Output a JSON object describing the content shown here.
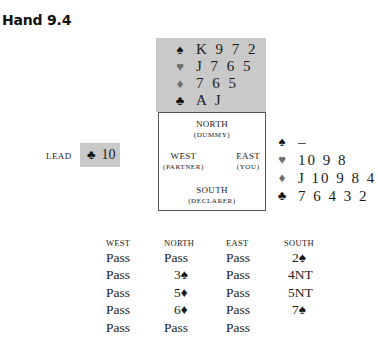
{
  "title": "Hand 9.4",
  "north_hand": {
    "spades": "K 9 7 2",
    "hearts": "J 7 6 5",
    "diamonds": "7 6 5",
    "clubs": "A J"
  },
  "east_hand": {
    "spades": "–",
    "hearts": "10 9 8",
    "diamonds": "J 10 9 8 4",
    "clubs": "7 6 4 3 2"
  },
  "suits": {
    "spade": "♠",
    "heart": "♥",
    "diamond": "♦",
    "club": "♣"
  },
  "compass": {
    "north": {
      "name": "NORTH",
      "role": "(DUMMY)"
    },
    "west": {
      "name": "WEST",
      "role": "(PARTNER)"
    },
    "east": {
      "name": "EAST",
      "role": "(YOU)"
    },
    "south": {
      "name": "SOUTH",
      "role": "(DECLARER)"
    }
  },
  "lead": {
    "label": "LEAD",
    "suit_symbol": "♣",
    "card": "10"
  },
  "auction": {
    "headers": [
      "WEST",
      "NORTH",
      "EAST",
      "SOUTH"
    ],
    "rows": [
      [
        "Pass",
        "Pass",
        "Pass",
        "2♠"
      ],
      [
        "Pass",
        "3♠",
        "Pass",
        "4NT"
      ],
      [
        "Pass",
        "5♦",
        "Pass",
        "5NT"
      ],
      [
        "Pass",
        "6♦",
        "Pass",
        "7♠"
      ],
      [
        "Pass",
        "Pass",
        "Pass",
        ""
      ]
    ]
  }
}
